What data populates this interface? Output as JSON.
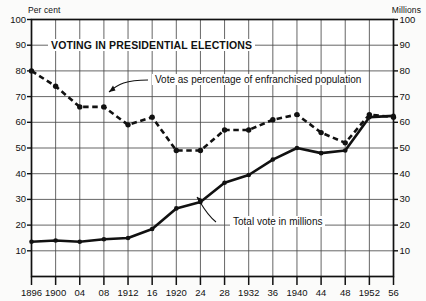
{
  "chart_data": {
    "type": "line",
    "title": "VOTING IN PRESIDENTIAL ELECTIONS",
    "xlabel": "",
    "ylabel": "Per cent",
    "y2label": "Millions",
    "ylim": [
      0,
      100
    ],
    "y2lim": [
      0,
      100
    ],
    "grid": true,
    "legend_position": "inline-annotations",
    "x": [
      1896,
      1900,
      1904,
      1908,
      1912,
      1916,
      1920,
      1924,
      1928,
      1932,
      1936,
      1940,
      1944,
      1948,
      1952,
      1956
    ],
    "categories": [
      "1896",
      "1900",
      "04",
      "08",
      "1912",
      "16",
      "1920",
      "24",
      "28",
      "1932",
      "36",
      "1940",
      "44",
      "48",
      "1952",
      "56"
    ],
    "y_ticks": [
      10,
      20,
      30,
      40,
      50,
      60,
      70,
      80,
      90,
      100
    ],
    "y2_ticks": [
      10,
      20,
      30,
      40,
      50,
      60,
      70,
      80,
      90,
      100
    ],
    "series": [
      {
        "name": "Vote as percentage of enfranchised population",
        "style": "dashed",
        "axis": "left",
        "unit": "per cent",
        "values": [
          80,
          74,
          66,
          66,
          59,
          62,
          49,
          49,
          57,
          57,
          61,
          63,
          56,
          52,
          63,
          62
        ]
      },
      {
        "name": "Total vote in millions",
        "style": "solid",
        "axis": "right",
        "unit": "millions",
        "values": [
          13.5,
          14.0,
          13.5,
          14.5,
          15.0,
          18.5,
          26.5,
          29.0,
          36.5,
          39.5,
          45.5,
          50.0,
          48.0,
          49.0,
          62.0,
          62.5
        ]
      }
    ],
    "annotations": [
      {
        "name": "percentage-series-label",
        "text": "Vote as percentage of enfranchised population"
      },
      {
        "name": "total-series-label",
        "text": "Total vote in millions"
      }
    ]
  }
}
